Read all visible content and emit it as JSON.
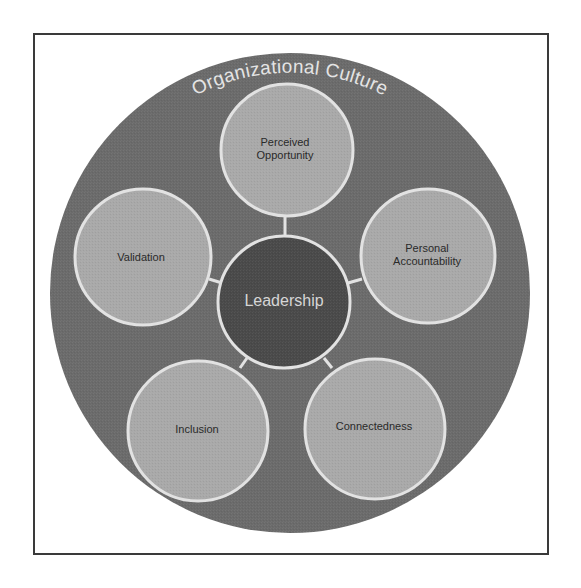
{
  "diagram": {
    "outer_label": "Organizational Culture",
    "center": {
      "label": "Leadership"
    },
    "nodes": [
      {
        "id": "perceived-opportunity",
        "lines": [
          "Perceived",
          "Opportunity"
        ]
      },
      {
        "id": "personal-accountability",
        "lines": [
          "Personal",
          "Accountability"
        ]
      },
      {
        "id": "connectedness",
        "lines": [
          "Connectedness"
        ]
      },
      {
        "id": "inclusion",
        "lines": [
          "Inclusion"
        ]
      },
      {
        "id": "validation",
        "lines": [
          "Validation"
        ]
      }
    ]
  },
  "colors": {
    "frame_border": "#3a3a3a",
    "outer_ring": "#6b6b6b",
    "node_fill": "#a9a9a9",
    "center_fill": "#4a4a4a",
    "outline": "#e2e2e2",
    "node_text": "#2a2a2a",
    "center_text": "#d6d6d6",
    "arc_text": "#e4e4e4"
  }
}
